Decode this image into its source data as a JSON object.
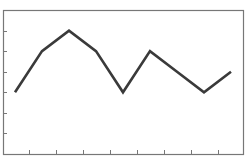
{
  "chart_data": {
    "type": "line",
    "title": "",
    "xlabel": "",
    "ylabel": "",
    "categories": [
      "1",
      "2",
      "3",
      "4",
      "5",
      "6",
      "7",
      "8",
      "9"
    ],
    "series": [
      {
        "name": "series-1",
        "values": [
          3,
          5,
          6,
          5,
          3,
          5,
          4,
          3,
          4
        ]
      }
    ],
    "ylim": [
      0,
      7
    ],
    "y_ticks": [
      1,
      2,
      3,
      4,
      5,
      6
    ],
    "x_tick_count": 8,
    "grid": false,
    "legend": "none",
    "tick_labels_visible": false
  },
  "style": {
    "line_color": "#3a3a3a",
    "frame_color": "#777777",
    "tick_color": "#777777",
    "background": "#ffffff"
  },
  "layout": {
    "plot_left": 3,
    "plot_top": 10,
    "plot_right": 243,
    "plot_bottom": 154,
    "first_point_x": 15,
    "point_spacing": 27
  }
}
